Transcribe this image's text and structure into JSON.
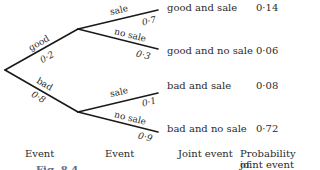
{
  "tree": {
    "level1": [
      {
        "label": "good",
        "prob": "0·2"
      },
      {
        "label": "bad",
        "prob": "0·8"
      }
    ],
    "level2": [
      {
        "label": "sale",
        "prob": "0·7"
      },
      {
        "label": "no sale",
        "prob": "0·3"
      },
      {
        "label": "sale",
        "prob": "0·1"
      },
      {
        "label": "no sale",
        "prob": "0·9"
      }
    ],
    "outcomes": [
      {
        "joint_event": "good and sale",
        "probability": "0·14"
      },
      {
        "joint_event": "good and no sale",
        "probability": "0·06"
      },
      {
        "joint_event": "bad and sale",
        "probability": "0·08"
      },
      {
        "joint_event": "bad and no sale",
        "probability": "0·72"
      }
    ]
  },
  "headers": {
    "col1": "Event",
    "col2": "Event",
    "col3": "Joint event",
    "col4_line1": "Probability of",
    "col4_line2": "joint event"
  },
  "caption": "Fig. 8.4"
}
